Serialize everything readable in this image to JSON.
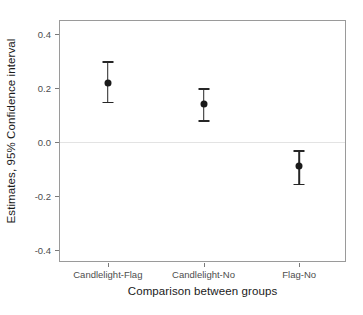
{
  "chart_data": {
    "type": "scatter",
    "title": "",
    "subtitle": "",
    "xlabel": "Comparison between groups",
    "ylabel": "Estimates, 95% Confidence interval",
    "categories": [
      "Candlelight-Flag",
      "Candlelight-No",
      "Flag-No"
    ],
    "values": [
      0.22,
      0.14,
      -0.09
    ],
    "ci_lower": [
      0.15,
      0.08,
      -0.155
    ],
    "ci_upper": [
      0.3,
      0.2,
      -0.03
    ],
    "series": [
      {
        "name": "Estimate with 95% CI",
        "points": [
          {
            "category": "Candlelight-Flag",
            "estimate": 0.22,
            "ci_lower": 0.15,
            "ci_upper": 0.3
          },
          {
            "category": "Candlelight-No",
            "estimate": 0.14,
            "ci_lower": 0.08,
            "ci_upper": 0.2
          },
          {
            "category": "Flag-No",
            "estimate": -0.09,
            "ci_lower": -0.155,
            "ci_upper": -0.03
          }
        ]
      }
    ],
    "ylim": [
      -0.45,
      0.45
    ],
    "y_ticks": [
      0.4,
      0.2,
      0.0,
      -0.2,
      -0.4
    ],
    "y_tick_labels": [
      "0.4",
      "0.2",
      "0.0",
      "-0.2",
      "-0.4"
    ],
    "x_tick_labels": [
      "Candlelight-Flag",
      "Candlelight-No",
      "Flag-No"
    ],
    "reference_line": 0.0,
    "grid": "zero-line-only",
    "legend": "none",
    "point_color": "#1a1a1a",
    "errorbar_color": "#262626",
    "panel_background": "#ffffff",
    "panel_border_color": "#9a9a9a",
    "gridline_color": "#e3e3e3"
  }
}
